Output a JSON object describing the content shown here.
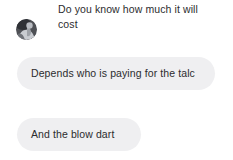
{
  "theme": {
    "page_background": "#ffffff",
    "bubble_background": "#efeff1",
    "text_color": "#2c2c2e",
    "avatar_background": "#8d8f93"
  },
  "conversation": {
    "messages": [
      {
        "id": "message-1",
        "sender": "other",
        "style": "plain",
        "has_avatar": true,
        "avatar_name": "contact-avatar",
        "text": "Do you know how much it will cost"
      },
      {
        "id": "message-2",
        "sender": "other",
        "style": "bubble",
        "has_avatar": false,
        "text": "Depends who is paying for the talc"
      },
      {
        "id": "message-3",
        "sender": "other",
        "style": "bubble",
        "has_avatar": false,
        "text": "And the blow dart"
      }
    ]
  }
}
